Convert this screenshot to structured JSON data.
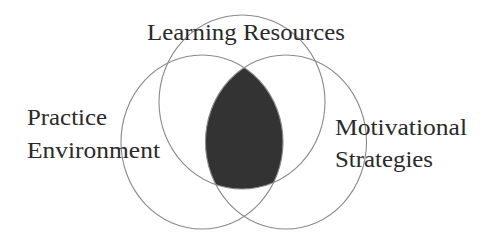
{
  "diagram": {
    "type": "venn",
    "title": "",
    "sets": [
      {
        "id": "learning",
        "label": "Learning Resources",
        "lines": [
          "Learning Resources"
        ]
      },
      {
        "id": "practice",
        "label": "Practice Environment",
        "lines": [
          "Practice",
          "Environment"
        ]
      },
      {
        "id": "motivation",
        "label": "Motivational Strategies",
        "lines": [
          "Motivational",
          "Strategies"
        ]
      }
    ],
    "highlighted_region": {
      "sets": [
        "Learning Resources",
        "Practice Environment",
        "Motivational Strategies"
      ],
      "description": "Intersection of all three sets (shaded)",
      "fill": "#333333"
    },
    "colors": {
      "outline": "#8a8a8a",
      "text": "#2a2a2a",
      "background": "#ffffff",
      "shade": "#333333"
    }
  }
}
